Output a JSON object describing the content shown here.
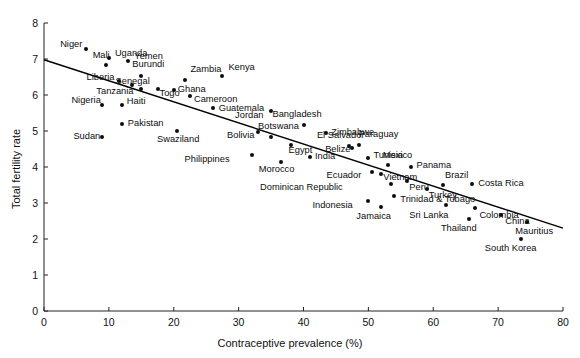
{
  "chart_data": {
    "type": "scatter",
    "title": "",
    "xlabel": "Contraceptive prevalence (%)",
    "ylabel": "Total fertility rate",
    "xlim": [
      0,
      80
    ],
    "ylim": [
      0,
      8
    ],
    "xticks": [
      0,
      10,
      20,
      30,
      40,
      50,
      60,
      70,
      80
    ],
    "yticks": [
      0,
      1,
      2,
      3,
      4,
      5,
      6,
      7,
      8
    ],
    "grid": false,
    "legend": null,
    "marker_color": "#0d0d0d",
    "line_color": "#000000",
    "trendline": {
      "type": "linear",
      "x_start": 0,
      "y_start": 6.98,
      "x_end": 80,
      "y_end": 2.3
    },
    "points": [
      {
        "label": "Niger",
        "x": 6.5,
        "y": 7.28,
        "lx": -34,
        "ly": -5
      },
      {
        "label": "Uganda",
        "x": 10.0,
        "y": 7.03,
        "lx": 6,
        "ly": -5
      },
      {
        "label": "Mali",
        "x": 9.5,
        "y": 6.82,
        "lx": -26,
        "ly": -10
      },
      {
        "label": "Yemen",
        "x": 13.0,
        "y": 6.94,
        "lx": 6,
        "ly": -5
      },
      {
        "label": "Burundi",
        "x": 15.0,
        "y": 6.53,
        "lx": -7,
        "ly": -12
      },
      {
        "label": "Zambia",
        "x": 21.8,
        "y": 6.41,
        "lx": 5,
        "ly": -11
      },
      {
        "label": "Liberia",
        "x": 11.5,
        "y": 6.4,
        "lx": -34,
        "ly": -4
      },
      {
        "label": "Senegal",
        "x": 13.5,
        "y": 6.28,
        "lx": -12,
        "ly": -4
      },
      {
        "label": "Tanzania",
        "x": 15.0,
        "y": 6.16,
        "lx": -38,
        "ly": 2
      },
      {
        "label": "Togo",
        "x": 17.5,
        "y": 6.18,
        "lx": -8,
        "ly": 4
      },
      {
        "label": "Ghana",
        "x": 20.0,
        "y": 6.15,
        "lx": 4,
        "ly": -1
      },
      {
        "label": "Cameroon",
        "x": 22.5,
        "y": 5.97,
        "lx": 4,
        "ly": 3
      },
      {
        "label": "Nigeria",
        "x": 9.0,
        "y": 5.72,
        "lx": -32,
        "ly": -5
      },
      {
        "label": "Haiti",
        "x": 12.0,
        "y": 5.72,
        "lx": 5,
        "ly": -4
      },
      {
        "label": "Guatemala",
        "x": 26.0,
        "y": 5.65,
        "lx": 6,
        "ly": 0
      },
      {
        "label": "Kenya",
        "x": 27.5,
        "y": 6.52,
        "lx": 6,
        "ly": -9
      },
      {
        "label": "Pakistan",
        "x": 12.0,
        "y": 5.19,
        "lx": 6,
        "ly": -1
      },
      {
        "label": "Sudan",
        "x": 9.0,
        "y": 4.83,
        "lx": -32,
        "ly": -1
      },
      {
        "label": "Swaziland",
        "x": 20.5,
        "y": 5.0,
        "lx": -8,
        "ly": 8
      },
      {
        "label": "Jordan",
        "x": 35.0,
        "y": 5.55,
        "lx": -38,
        "ly": 4
      },
      {
        "label": "Bolivia",
        "x": 33.0,
        "y": 4.98,
        "lx": -34,
        "ly": 3
      },
      {
        "label": "Botswana",
        "x": 35.0,
        "y": 4.83,
        "lx": -2,
        "ly": -11
      },
      {
        "label": "Philippines",
        "x": 32.0,
        "y": 4.33,
        "lx": -52,
        "ly": 4
      },
      {
        "label": "Bangladesh",
        "x": 40.0,
        "y": 5.17,
        "lx": -12,
        "ly": -11
      },
      {
        "label": "Egypt",
        "x": 38.0,
        "y": 4.6,
        "lx": -8,
        "ly": 5
      },
      {
        "label": "Morocco",
        "x": 36.5,
        "y": 4.15,
        "lx": -16,
        "ly": 7
      },
      {
        "label": "India",
        "x": 41.0,
        "y": 4.28,
        "lx": 5,
        "ly": -1
      },
      {
        "label": "Zimbabwe",
        "x": 43.5,
        "y": 4.95,
        "lx": 5,
        "ly": -1
      },
      {
        "label": "El Salvador",
        "x": 47.0,
        "y": 4.58,
        "lx": -14,
        "ly": -11
      },
      {
        "label": "Belize",
        "x": 47.5,
        "y": 4.52,
        "lx": -32,
        "ly": 1
      },
      {
        "label": "Paraguay",
        "x": 48.5,
        "y": 4.6,
        "lx": 0,
        "ly": -11
      },
      {
        "label": "Tunisia",
        "x": 50.0,
        "y": 4.25,
        "lx": 5,
        "ly": -3
      },
      {
        "label": "Mexico",
        "x": 53.0,
        "y": 4.05,
        "lx": -6,
        "ly": -10
      },
      {
        "label": "Panama",
        "x": 56.5,
        "y": 4.0,
        "lx": 6,
        "ly": -2
      },
      {
        "label": "Ecuador",
        "x": 50.5,
        "y": 3.85,
        "lx": -40,
        "ly": 3
      },
      {
        "label": "Vietnam",
        "x": 52.0,
        "y": 3.8,
        "lx": 2,
        "ly": 3
      },
      {
        "label": "Peru",
        "x": 56.0,
        "y": 3.6,
        "lx": 2,
        "ly": 6
      },
      {
        "label": "Brazil",
        "x": 61.5,
        "y": 3.5,
        "lx": 2,
        "ly": -10
      },
      {
        "label": "Costa Rica",
        "x": 66.0,
        "y": 3.52,
        "lx": 6,
        "ly": -1
      },
      {
        "label": "Dominican Republic",
        "x": 53.5,
        "y": 3.52,
        "lx": -78,
        "ly": 3
      },
      {
        "label": "Turkey",
        "x": 59.0,
        "y": 3.4,
        "lx": 2,
        "ly": 6
      },
      {
        "label": "Trinidad & Tobago",
        "x": 54.0,
        "y": 3.2,
        "lx": 6,
        "ly": 3
      },
      {
        "label": "Indonesia",
        "x": 50.0,
        "y": 3.05,
        "lx": -46,
        "ly": 4
      },
      {
        "label": "Jamaica",
        "x": 52.0,
        "y": 2.9,
        "lx": -20,
        "ly": 9
      },
      {
        "label": "Sri Lanka",
        "x": 62.0,
        "y": 2.95,
        "lx": -28,
        "ly": 10
      },
      {
        "label": "Colombia",
        "x": 66.5,
        "y": 2.85,
        "lx": 4,
        "ly": 7
      },
      {
        "label": "Thailand",
        "x": 65.5,
        "y": 2.55,
        "lx": -22,
        "ly": 9
      },
      {
        "label": "China",
        "x": 70.5,
        "y": 2.68,
        "lx": 4,
        "ly": 6
      },
      {
        "label": "Mauritius",
        "x": 74.5,
        "y": 2.47,
        "lx": -4,
        "ly": 9
      },
      {
        "label": "South Korea",
        "x": 73.5,
        "y": 2.0,
        "lx": -14,
        "ly": 9
      }
    ]
  }
}
